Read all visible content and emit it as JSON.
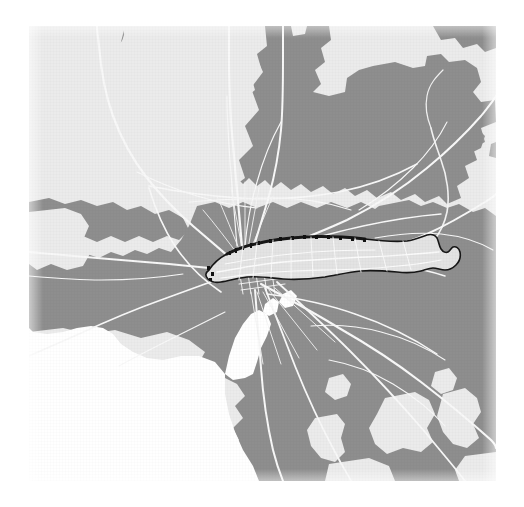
{
  "document": {
    "type": "static-map-figure",
    "title": "",
    "caption": ""
  },
  "map": {
    "name": "melbourne-region-choropleth",
    "description": "Greater Melbourne metropolitan map with one administrative district highlighted",
    "orientation": "north-up",
    "frame": {
      "x": 29,
      "y": 26,
      "width": 467,
      "height": 455
    },
    "page_background": "#ffffff"
  },
  "legend": {
    "visible": false,
    "entries": [
      {
        "id": "urban",
        "label": "",
        "color": "#8e8e8e",
        "role": "built-up / urban area"
      },
      {
        "id": "rural",
        "label": "",
        "color": "#ebebeb",
        "role": "non-urban / background land"
      },
      {
        "id": "water",
        "label": "",
        "color": "#ffffff",
        "role": "water body (bay, river)"
      },
      {
        "id": "roads",
        "label": "",
        "color": "#f7f7f7",
        "role": "road and rail network"
      },
      {
        "id": "highlight",
        "label": "",
        "color": "#e3e3e3",
        "role": "selected district fill"
      },
      {
        "id": "highlight-outline",
        "label": "",
        "color": "#1a1a1a",
        "role": "selected district boundary"
      }
    ]
  },
  "colors": {
    "urban": "#8e8e8e",
    "urban_edge": "#959595",
    "rural": "#ebebeb",
    "water": "#ffffff",
    "road": "#f6f6f6",
    "road_minor": "#e6e6e6",
    "highlight_fill": "#e3e3e3",
    "highlight_stroke": "#161616",
    "page": "#ffffff"
  },
  "highlight": {
    "name": "selected-district",
    "shape": "elongated east-west polygon",
    "selected": true,
    "stroke_width_px": 1.6
  },
  "scale_bar": {
    "visible": false,
    "label": ""
  },
  "north_arrow": {
    "visible": false,
    "label": ""
  },
  "attribution": {
    "visible": false,
    "text": ""
  },
  "labels": {
    "visible": false,
    "items": []
  }
}
